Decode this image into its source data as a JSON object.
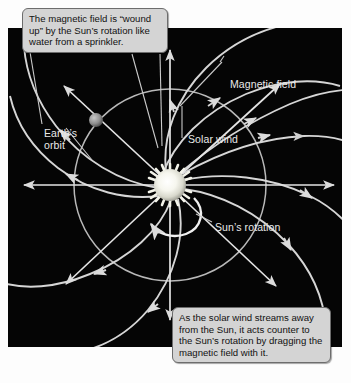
{
  "diagram": {
    "background_color": "#050505",
    "line_color": "#d8d8d8",
    "callouts": [
      {
        "name": "magnetic-field-winding-callout",
        "text": "The magnetic field is “wound up” by the Sun’s rotation like water from a sprinkler."
      },
      {
        "name": "solar-wind-dragging-callout",
        "text": "As the solar wind streams away from the Sun, it acts counter to the Sun’s rotation by dragging the magnetic field with it."
      }
    ],
    "labels": [
      {
        "name": "magnetic-field-label",
        "text": "Magnetic field"
      },
      {
        "name": "solar-wind-label",
        "text": "Solar wind"
      },
      {
        "name": "earth-orbit-label",
        "text": "Earth’s\norbit"
      },
      {
        "name": "suns-rotation-label",
        "text": "Sun’s rotation"
      }
    ],
    "objects": {
      "sun": {
        "name": "sun",
        "color": "#f2f2e8"
      },
      "earth": {
        "name": "earth",
        "color": "#9a9a9a"
      }
    }
  }
}
